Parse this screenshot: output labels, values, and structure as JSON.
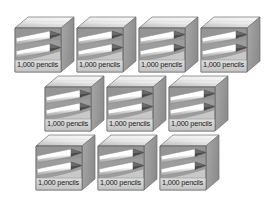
{
  "illustration": {
    "title": "Ten boxes of pencils",
    "background_color": "#ffffff",
    "box_label": "1,000 pencils",
    "unit_count": 1000,
    "unit_name": "pencils",
    "total_boxes": 10,
    "total_items": 10000,
    "rows": [
      {
        "row_index": 1,
        "box_count": 4,
        "boxes": [
          {
            "label": "1,000 pencils"
          },
          {
            "label": "1,000 pencils"
          },
          {
            "label": "1,000 pencils"
          },
          {
            "label": "1,000 pencils"
          }
        ]
      },
      {
        "row_index": 2,
        "box_count": 3,
        "boxes": [
          {
            "label": "1,000 pencils"
          },
          {
            "label": "1,000 pencils"
          },
          {
            "label": "1,000 pencils"
          }
        ]
      },
      {
        "row_index": 3,
        "box_count": 3,
        "boxes": [
          {
            "label": "1,000 pencils"
          },
          {
            "label": "1,000 pencils"
          },
          {
            "label": "1,000 pencils"
          }
        ]
      }
    ],
    "colors": {
      "box_top_light": "#e8e8e8",
      "box_top_dark": "#b9b9b9",
      "box_front_light": "#d6d6d6",
      "box_front_dark": "#9a9a9a",
      "box_side": "#a8a8a8",
      "box_side_dark": "#8d8d8d",
      "box_outline": "#6f6f6f",
      "pencil_body": "#f4f4f4",
      "pencil_shade": "#c2c2c2",
      "pencil_tip": "#4a4a4a",
      "label_text": "#1b1b1b",
      "label_panel": "#cfcfcf"
    }
  }
}
